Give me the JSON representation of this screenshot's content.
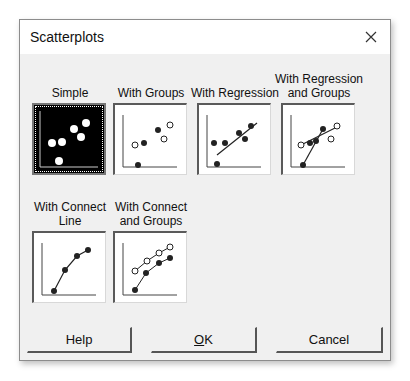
{
  "dialog": {
    "title": "Scatterplots",
    "close_icon": "close-icon"
  },
  "options": [
    {
      "id": "simple",
      "label_lines": [
        "Simple"
      ],
      "selected": true
    },
    {
      "id": "with-groups",
      "label_lines": [
        "With Groups"
      ],
      "selected": false
    },
    {
      "id": "with-regression",
      "label_lines": [
        "With Regression"
      ],
      "selected": false
    },
    {
      "id": "with-regression-and-groups",
      "label_lines": [
        "With Regression",
        "and Groups"
      ],
      "selected": false
    },
    {
      "id": "with-connect-line",
      "label_lines": [
        "With Connect",
        "Line"
      ],
      "selected": false
    },
    {
      "id": "with-connect-and-groups",
      "label_lines": [
        "With Connect",
        "and Groups"
      ],
      "selected": false
    }
  ],
  "buttons": {
    "help": "Help",
    "ok_mnemonic": "O",
    "ok_rest": "K",
    "cancel": "Cancel"
  },
  "colors": {
    "dialog_bg": "#f0f0f0",
    "titlebar_bg": "#ffffff",
    "selected_thumb_bg": "#000000"
  }
}
